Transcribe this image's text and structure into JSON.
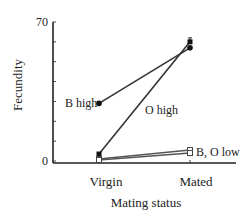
{
  "chart_data": {
    "type": "line",
    "title": "",
    "xlabel": "Mating status",
    "ylabel": "Fecundity",
    "categories": [
      "Virgin",
      "Mated"
    ],
    "ylim": [
      0,
      70
    ],
    "y_tick_labels": [
      "0",
      "70"
    ],
    "y_minor_ticks": [
      0,
      10,
      20,
      30,
      40,
      50,
      60,
      70
    ],
    "grid": false,
    "legend": "inline labels",
    "series": [
      {
        "name": "B high",
        "values": [
          29,
          57
        ],
        "marker": "filled",
        "label": "B high"
      },
      {
        "name": "O high",
        "values": [
          3.5,
          60
        ],
        "marker": "filled",
        "label": "O high",
        "error_bar_mated": 2
      },
      {
        "name": "B low",
        "values": [
          1,
          5.5
        ],
        "marker": "open",
        "label": "B, O low"
      },
      {
        "name": "O low",
        "values": [
          0.5,
          4
        ],
        "marker": "open",
        "label": ""
      }
    ],
    "annotations": [
      "B high",
      "O high",
      "B, O low"
    ]
  },
  "axes": {
    "x_label": "Mating status",
    "y_label": "Fecundity",
    "y_top": "70",
    "y_bottom": "0",
    "x_cat_0": "Virgin",
    "x_cat_1": "Mated"
  },
  "labels": {
    "b_high": "B high",
    "o_high": "O high",
    "low": "B, O low"
  }
}
